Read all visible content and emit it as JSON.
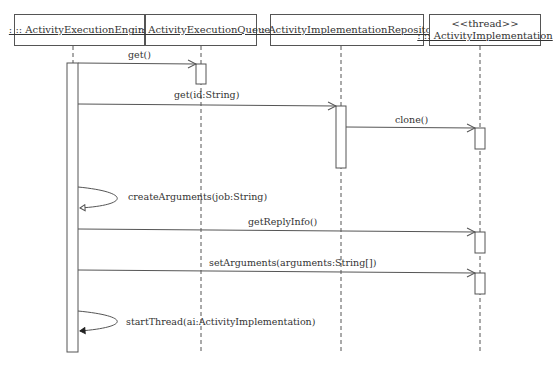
{
  "diagram": {
    "type": "uml-sequence",
    "lifelines": [
      {
        "id": "engine",
        "name": ": :: ActivityExecutionEngine",
        "stereotype": null
      },
      {
        "id": "queue",
        "name": ": :: ActivityExecutionQueue",
        "stereotype": null
      },
      {
        "id": "repo",
        "name": ": :: ActivityImplementationRepository",
        "stereotype": null
      },
      {
        "id": "impl",
        "name": ": :: ActivityImplementation",
        "stereotype": "<<thread>>"
      }
    ],
    "messages": [
      {
        "from": "engine",
        "to": "queue",
        "label": "get()",
        "kind": "sync"
      },
      {
        "from": "engine",
        "to": "repo",
        "label": "get(id:String)",
        "kind": "sync"
      },
      {
        "from": "repo",
        "to": "impl",
        "label": "clone()",
        "kind": "sync"
      },
      {
        "from": "engine",
        "to": "engine",
        "label": "createArguments(job:String)",
        "kind": "self"
      },
      {
        "from": "engine",
        "to": "impl",
        "label": "getReplyInfo()",
        "kind": "sync"
      },
      {
        "from": "engine",
        "to": "impl",
        "label": "setArguments(arguments:String[])",
        "kind": "sync"
      },
      {
        "from": "engine",
        "to": "engine",
        "label": "startThread(ai:ActivityImplementation)",
        "kind": "self"
      }
    ],
    "colors": {
      "line": "#555555",
      "text": "#333333",
      "background": "#ffffff"
    }
  }
}
